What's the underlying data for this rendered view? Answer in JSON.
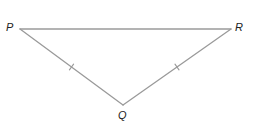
{
  "figure": {
    "type": "isosceles-triangle",
    "line_color": "#9a9a9a",
    "label_color": "#222222",
    "vertices": [
      {
        "name": "P",
        "x": 20,
        "y": 29,
        "label_x": 6,
        "label_y": 22
      },
      {
        "name": "R",
        "x": 231,
        "y": 29,
        "label_x": 235,
        "label_y": 22
      },
      {
        "name": "Q",
        "x": 123,
        "y": 105,
        "label_x": 118,
        "label_y": 110
      }
    ],
    "sides": [
      {
        "from": "P",
        "to": "R",
        "tick_marks": 0
      },
      {
        "from": "P",
        "to": "Q",
        "tick_marks": 1
      },
      {
        "from": "Q",
        "to": "R",
        "tick_marks": 1
      }
    ],
    "congruent_sides": [
      "PQ",
      "QR"
    ]
  }
}
